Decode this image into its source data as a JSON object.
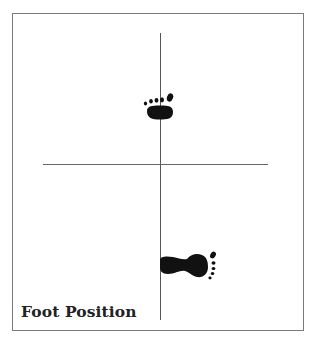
{
  "figure": {
    "caption": "Foot Position",
    "colors": {
      "border": "#7a7a7a",
      "axis": "#555555",
      "foot": "#111111",
      "background": "#ffffff"
    },
    "feet": [
      {
        "name": "front-foot",
        "orientation": "toes-up",
        "icon": "footprint-icon"
      },
      {
        "name": "rear-foot",
        "orientation": "toes-right",
        "icon": "footprint-icon"
      }
    ]
  }
}
